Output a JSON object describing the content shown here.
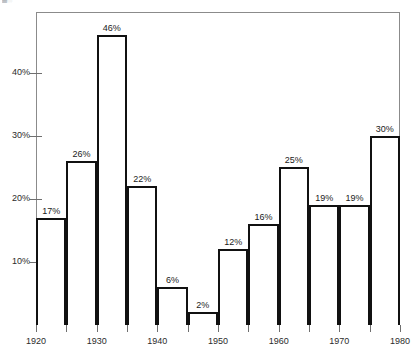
{
  "top_strip": {
    "clipped_text": "▓░ — ——— —— ————— ———"
  },
  "chart_data": {
    "type": "bar",
    "title": "",
    "subtitle": "",
    "xlabel": "",
    "ylabel": "",
    "grid": false,
    "legend": null,
    "bar_style": "outlined-white",
    "categories": [
      "1920",
      "1925",
      "1930",
      "1935",
      "1940",
      "1945",
      "1950",
      "1955",
      "1960",
      "1965",
      "1970",
      "1975"
    ],
    "values": [
      17,
      26,
      46,
      22,
      6,
      2,
      12,
      16,
      25,
      19,
      19,
      30
    ],
    "value_labels": [
      "17%",
      "26%",
      "46%",
      "22%",
      "6%",
      "2%",
      "12%",
      "16%",
      "25%",
      "19%",
      "19%",
      "30%"
    ],
    "bar_interval_years": 5,
    "x_axis": {
      "ticks": [
        1920,
        1925,
        1930,
        1935,
        1940,
        1945,
        1950,
        1955,
        1960,
        1965,
        1970,
        1975,
        1980
      ],
      "labeled_ticks": [
        1920,
        1930,
        1940,
        1950,
        1960,
        1970,
        1980
      ],
      "tick_labels": [
        "1920",
        "1930",
        "1940",
        "1950",
        "1960",
        "1970",
        "1980"
      ],
      "xlim": [
        1920,
        1980
      ]
    },
    "y_axis": {
      "ticks": [
        10,
        20,
        30,
        40
      ],
      "tick_labels": [
        "10%",
        "20%",
        "30%",
        "40%"
      ],
      "ylim": [
        0,
        49.6
      ],
      "unit": "percent"
    },
    "colors": {
      "bar_outline": "#111111",
      "bar_fill": "#ffffff",
      "axis": "#6f6f6f",
      "frame": "#8b8b8b",
      "text": "#1a1a1a",
      "background": "#ffffff"
    }
  }
}
